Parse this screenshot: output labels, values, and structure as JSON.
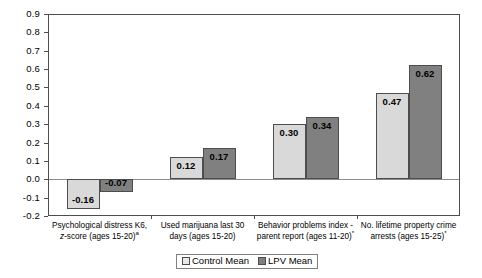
{
  "chart_data": {
    "type": "bar",
    "title": "",
    "subtitle": "",
    "xlabel": "",
    "ylabel": "",
    "ylim": [
      -0.2,
      0.9
    ],
    "ytick_step": 0.1,
    "grid": false,
    "legend_position": "bottom-center",
    "yticks": [
      "0.9",
      "0.8",
      "0.7",
      "0.6",
      "0.5",
      "0.4",
      "0.3",
      "0.2",
      "0.1",
      "0.0",
      "-0.1",
      "-0.2"
    ],
    "ytick_values": [
      0.9,
      0.8,
      0.7,
      0.6,
      0.5,
      0.4,
      0.3,
      0.2,
      0.1,
      0.0,
      -0.1,
      -0.2
    ],
    "categories": [
      {
        "line1": "Psychological distress K6,",
        "line2_pre": "",
        "line2_italic": "z",
        "line2_post": "-score (ages 15-20)",
        "superscript": "a"
      },
      {
        "line1": "Used marijuana last 30",
        "line2_pre": "days (ages 15-20)",
        "line2_italic": "",
        "line2_post": "",
        "superscript": ""
      },
      {
        "line1": "Behavior problems index -",
        "line2_pre": "parent report (ages 11-20)",
        "line2_italic": "",
        "line2_post": "",
        "superscript": "*"
      },
      {
        "line1": "No. lifetime property crime",
        "line2_pre": "arrests (ages 15-25)",
        "line2_italic": "",
        "line2_post": "",
        "superscript": "*"
      }
    ],
    "series": [
      {
        "name": "Control Mean",
        "color": "#d9d9d9",
        "values": [
          -0.16,
          0.12,
          0.3,
          0.47
        ],
        "labels": [
          "-0.16",
          "0.12",
          "0.30",
          "0.47"
        ]
      },
      {
        "name": "LPV Mean",
        "color": "#808080",
        "values": [
          -0.07,
          0.17,
          0.34,
          0.62
        ],
        "labels": [
          "-0.07",
          "0.17",
          "0.34",
          "0.62"
        ]
      }
    ]
  },
  "legend": {
    "items": [
      {
        "label": "Control Mean",
        "swatch": "control"
      },
      {
        "label": "LPV Mean",
        "swatch": "lpv"
      }
    ]
  }
}
